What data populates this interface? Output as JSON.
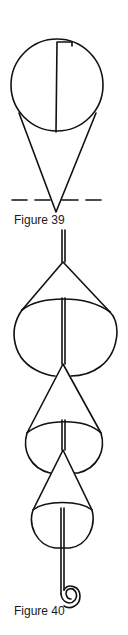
{
  "figures": [
    {
      "id": "fig39",
      "caption": "Figure 39",
      "description": "Circle with vertical split line atop a cone, with dashed horizontal line at cone apex"
    },
    {
      "id": "fig40",
      "caption": "Figure 40",
      "description": "Three stacked cones threaded on a double rod ending in a spiral hook"
    }
  ],
  "colors": {
    "stroke": "#111111",
    "background": "#ffffff"
  }
}
